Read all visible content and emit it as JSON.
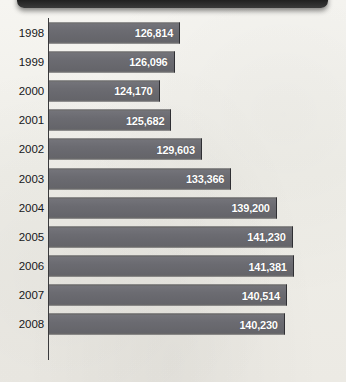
{
  "banner": {
    "label": ""
  },
  "chart_data": {
    "type": "bar",
    "orientation": "horizontal",
    "title": "",
    "xlabel": "",
    "ylabel": "",
    "grid": false,
    "legend": false,
    "axis_truncated": true,
    "xlim": [
      110000,
      145000
    ],
    "categories": [
      "1998",
      "1999",
      "2000",
      "2001",
      "2002",
      "2003",
      "2004",
      "2005",
      "2006",
      "2007",
      "2008"
    ],
    "values": [
      126814,
      126096,
      124170,
      125682,
      129603,
      133366,
      139200,
      141230,
      141381,
      140514,
      140230
    ],
    "value_labels": [
      "126,814",
      "126,096",
      "124,170",
      "125,682",
      "129,603",
      "133,366",
      "139,200",
      "141,230",
      "141,381",
      "140,514",
      "140,230"
    ],
    "bar_color": "#6b6b71",
    "bar_border_color": "#2f2f33",
    "value_label_color": "#ffffff",
    "background_color": "#f2f1ec",
    "axis_color": "#3a3a3c"
  }
}
